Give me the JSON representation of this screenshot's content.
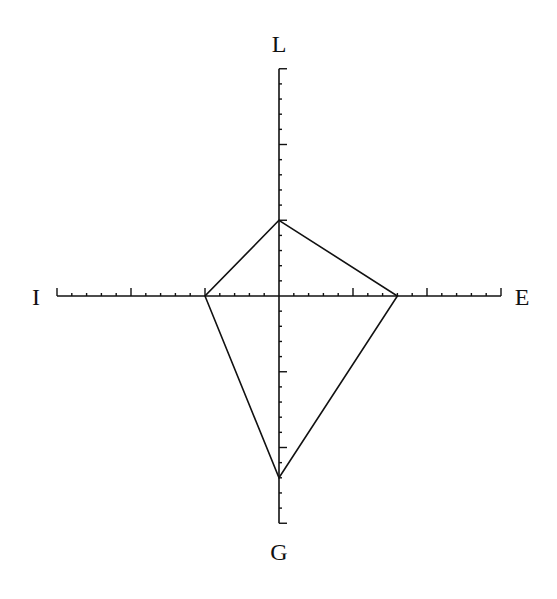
{
  "chart_data": {
    "type": "radar",
    "title": "",
    "axes": [
      {
        "name": "L",
        "direction": "up",
        "max": 15,
        "minor_tick_step": 1,
        "major_tick_step": 5
      },
      {
        "name": "E",
        "direction": "right",
        "max": 15,
        "minor_tick_step": 1,
        "major_tick_step": 5
      },
      {
        "name": "G",
        "direction": "down",
        "max": 15,
        "minor_tick_step": 1,
        "major_tick_step": 5
      },
      {
        "name": "I",
        "direction": "left",
        "max": 15,
        "minor_tick_step": 1,
        "major_tick_step": 5
      }
    ],
    "categories": [
      "L",
      "E",
      "G",
      "I"
    ],
    "values": [
      5,
      8,
      12,
      5
    ],
    "grid": false,
    "legend": null
  },
  "labels": {
    "top": "L",
    "right": "E",
    "bottom": "G",
    "left": "I"
  },
  "colors": {
    "line": "#111111",
    "background": "#ffffff"
  }
}
